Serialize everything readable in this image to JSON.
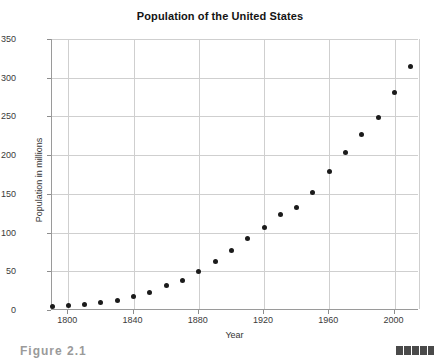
{
  "figure": {
    "caption": "Figure 2.1",
    "page_marker_name": "page-edge-marker"
  },
  "chart_data": {
    "type": "scatter",
    "title": "Population of the United States",
    "xlabel": "Year",
    "ylabel": "Population in millions",
    "xlim": [
      1790,
      2015
    ],
    "ylim": [
      0,
      350
    ],
    "xticks": [
      1800,
      1840,
      1880,
      1920,
      1960,
      2000
    ],
    "yticks": [
      0,
      50,
      100,
      150,
      200,
      250,
      300,
      350
    ],
    "grid": true,
    "legend": null,
    "marker": "filled-circle",
    "marker_color": "#1b1b1b",
    "x": [
      1790,
      1800,
      1810,
      1820,
      1830,
      1840,
      1850,
      1860,
      1870,
      1880,
      1890,
      1900,
      1910,
      1920,
      1930,
      1940,
      1950,
      1960,
      1970,
      1980,
      1990,
      2000,
      2010
    ],
    "y": [
      3.9,
      5.3,
      7.2,
      9.6,
      12.9,
      17.1,
      23.2,
      31.4,
      38.6,
      50.2,
      62.9,
      76.2,
      92.2,
      106.0,
      123.2,
      132.2,
      151.3,
      179.3,
      203.3,
      226.5,
      248.7,
      281.4,
      313.9
    ]
  }
}
